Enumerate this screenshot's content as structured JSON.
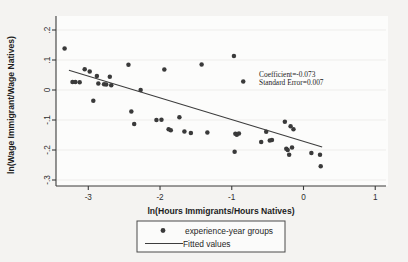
{
  "chart_data": {
    "type": "scatter",
    "title": "",
    "xlabel": "ln(Hours Immigrants/Hours Natives)",
    "ylabel": "ln(Wage Immigrant/Wage Natives)",
    "xlim": [
      -3.45,
      1.15
    ],
    "ylim": [
      -0.32,
      0.22
    ],
    "xticks": [
      -3,
      -2,
      -1,
      0,
      1
    ],
    "xticklabels": [
      "-3",
      "-2",
      "-1",
      "0",
      "1"
    ],
    "yticks": [
      0.2,
      0.1,
      0,
      -0.1,
      -0.2,
      -0.3
    ],
    "yticklabels": [
      ".2",
      ".1",
      "0",
      "-.1",
      "-.2",
      "-.3"
    ],
    "grid": false,
    "legend_position": "below-axes",
    "series": [
      {
        "name": "experience-year groups",
        "type": "scatter",
        "marker": "circle",
        "color": "#3a3a3a",
        "points": [
          [
            -3.33,
            0.138
          ],
          [
            -3.22,
            0.027
          ],
          [
            -3.18,
            0.027
          ],
          [
            -3.12,
            0.026
          ],
          [
            -3.05,
            0.069
          ],
          [
            -2.98,
            0.062
          ],
          [
            -2.93,
            -0.036
          ],
          [
            -2.88,
            0.047
          ],
          [
            -2.86,
            0.022
          ],
          [
            -2.78,
            0.019
          ],
          [
            -2.75,
            0.018
          ],
          [
            -2.7,
            0.044
          ],
          [
            -2.68,
            0.016
          ],
          [
            -2.44,
            0.084
          ],
          [
            -2.4,
            -0.072
          ],
          [
            -2.36,
            -0.113
          ],
          [
            -2.27,
            0.0
          ],
          [
            -2.05,
            -0.1
          ],
          [
            -1.98,
            -0.099
          ],
          [
            -1.94,
            0.068
          ],
          [
            -1.88,
            -0.131
          ],
          [
            -1.85,
            -0.134
          ],
          [
            -1.73,
            -0.091
          ],
          [
            -1.66,
            -0.138
          ],
          [
            -1.57,
            -0.143
          ],
          [
            -1.42,
            0.085
          ],
          [
            -1.34,
            -0.142
          ],
          [
            -0.97,
            0.113
          ],
          [
            -0.96,
            -0.206
          ],
          [
            -0.95,
            -0.146
          ],
          [
            -0.93,
            -0.149
          ],
          [
            -0.9,
            -0.145
          ],
          [
            -0.84,
            0.028
          ],
          [
            -0.59,
            -0.173
          ],
          [
            -0.52,
            -0.139
          ],
          [
            -0.47,
            -0.168
          ],
          [
            -0.44,
            -0.167
          ],
          [
            -0.26,
            -0.106
          ],
          [
            -0.24,
            -0.196
          ],
          [
            -0.22,
            -0.2
          ],
          [
            -0.2,
            -0.216
          ],
          [
            -0.18,
            -0.121
          ],
          [
            -0.16,
            -0.192
          ],
          [
            -0.14,
            -0.131
          ],
          [
            0.11,
            -0.21
          ],
          [
            0.23,
            -0.216
          ],
          [
            0.24,
            -0.254
          ]
        ]
      },
      {
        "name": "Fitted values",
        "type": "line",
        "color": "#3d3d3d",
        "x_start": -3.27,
        "y_start": 0.066,
        "x_end": 0.26,
        "y_end": -0.19
      }
    ],
    "annotations": [
      {
        "text": "Coefficient=-0.073",
        "x": -0.62,
        "y": 0.044
      },
      {
        "text": "Standard Error=0.007",
        "x": -0.62,
        "y": 0.017
      }
    ],
    "legend": {
      "items": [
        {
          "label": "experience-year groups",
          "marker": "circle"
        },
        {
          "label": "Fitted values",
          "marker": "line"
        }
      ]
    },
    "colors": {
      "marker": "#3a3a3a",
      "line": "#3d3d3d",
      "axis": "#3b3b3b",
      "background": "#f4f3f1",
      "plot_area": "#fcfcfb"
    }
  }
}
